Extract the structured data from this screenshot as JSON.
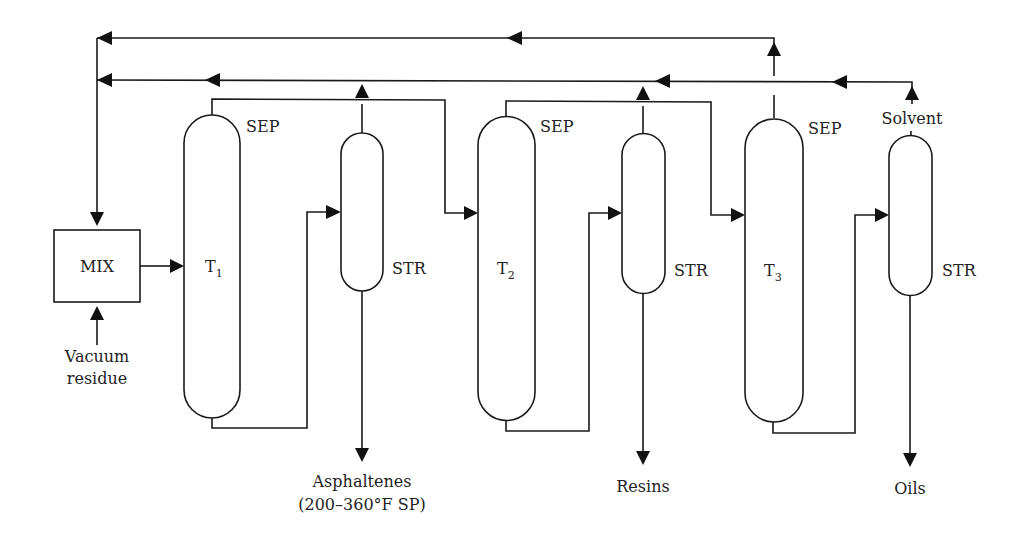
{
  "diagram": {
    "type": "process-flow-diagram",
    "units": {
      "mixer": {
        "label": "MIX"
      },
      "towers": [
        {
          "id": "T1",
          "main": "T",
          "sub": "1",
          "role": "SEP"
        },
        {
          "id": "T2",
          "main": "T",
          "sub": "2",
          "role": "SEP"
        },
        {
          "id": "T3",
          "main": "T",
          "sub": "3",
          "role": "SEP"
        }
      ],
      "strippers": [
        {
          "id": "STR1",
          "label": "STR"
        },
        {
          "id": "STR2",
          "label": "STR"
        },
        {
          "id": "STR3",
          "label": "STR"
        }
      ]
    },
    "streams": {
      "feed_line1": "Vacuum",
      "feed_line2": "residue",
      "product1_line1": "Asphaltenes",
      "product1_line2": "(200–360°F SP)",
      "product2": "Resins",
      "product3": "Oils",
      "solvent": "Solvent"
    },
    "connections": [
      {
        "from": "Vacuum residue",
        "to": "MIX"
      },
      {
        "from": "MIX",
        "to": "T1"
      },
      {
        "from": "T1 top",
        "to": "T2"
      },
      {
        "from": "T1 bottom",
        "to": "STR1"
      },
      {
        "from": "STR1 top",
        "to": "solvent recycle"
      },
      {
        "from": "STR1 bottom",
        "to": "Asphaltenes"
      },
      {
        "from": "T2 top",
        "to": "T3"
      },
      {
        "from": "T2 bottom",
        "to": "STR2"
      },
      {
        "from": "STR2 top",
        "to": "solvent recycle"
      },
      {
        "from": "STR2 bottom",
        "to": "Resins"
      },
      {
        "from": "T3 top",
        "to": "solvent recycle (upper)"
      },
      {
        "from": "T3 bottom",
        "to": "STR3"
      },
      {
        "from": "STR3 top",
        "to": "Solvent recycle"
      },
      {
        "from": "STR3 bottom",
        "to": "Oils"
      },
      {
        "from": "solvent recycle",
        "to": "MIX"
      }
    ]
  }
}
